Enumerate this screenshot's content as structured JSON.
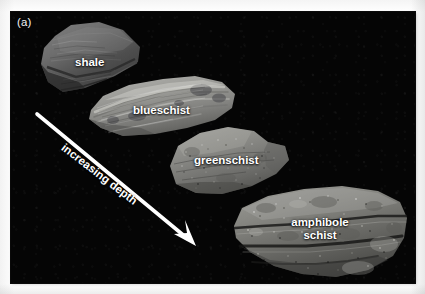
{
  "figure": {
    "panel_label": "(a)",
    "background_color": "#050505",
    "page_color": "#ffffff",
    "label_color": "#ffffff"
  },
  "annotation": {
    "arrow_label": "increasing depth",
    "arrow_color": "#ffffff",
    "arrow_rotation_degrees": 37.5,
    "arrow_start": {
      "x": 37,
      "y": 114
    },
    "arrow_end": {
      "x": 196,
      "y": 246
    }
  },
  "specimens": [
    {
      "id": "shale",
      "label": "shale",
      "order": 1,
      "tone": "#6a6a6a",
      "label_color": "#ffffff"
    },
    {
      "id": "blueschist",
      "label": "blueschist",
      "order": 2,
      "tone": "#9a9a98",
      "label_color": "#ffffff"
    },
    {
      "id": "greenschist",
      "label": "greenschist",
      "order": 3,
      "tone": "#8b8b8b",
      "label_color": "#ffffff"
    },
    {
      "id": "amphibole-schist",
      "label_line1": "amphibole",
      "label_line2": "schist",
      "order": 4,
      "tone": "#838383",
      "label_color": "#ffffff"
    }
  ]
}
